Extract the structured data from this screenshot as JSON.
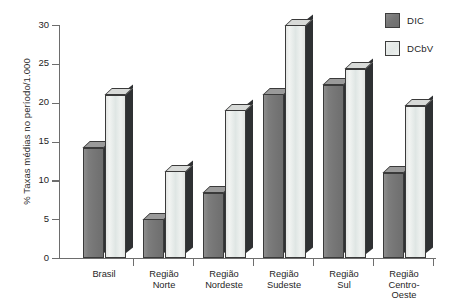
{
  "chart_data": {
    "type": "bar",
    "title": "",
    "xlabel": "",
    "ylabel": "% Taxas médias no período/1.000",
    "ylim": [
      0,
      30
    ],
    "yticks": [
      0,
      5,
      10,
      15,
      20,
      25,
      30
    ],
    "ytick_labels": [
      "0",
      "5",
      "10",
      "15",
      "20",
      "25",
      "30"
    ],
    "grid": false,
    "legend_position": "top-right",
    "categories": [
      "Brasil",
      "Região\nNorte",
      "Região\nNordeste",
      "Região\nSudeste",
      "Região\nSul",
      "Região\nCentro-\nOeste"
    ],
    "series": [
      {
        "name": "DIC",
        "color": "#757575",
        "values": [
          14.2,
          5.0,
          8.4,
          21.1,
          22.3,
          11.0
        ]
      },
      {
        "name": "DCbV",
        "color": "#e8ebe9",
        "values": [
          21.0,
          11.2,
          19.0,
          30.0,
          24.4,
          19.6
        ]
      }
    ]
  },
  "legend": {
    "items": [
      {
        "label": "DIC"
      },
      {
        "label": "DCbV"
      }
    ]
  }
}
